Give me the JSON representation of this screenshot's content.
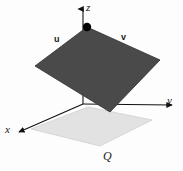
{
  "figure": {
    "background": "#fdfdfd"
  },
  "axes": {
    "z": {
      "label": "z",
      "origin": [
        83,
        104
      ],
      "tip": [
        83,
        5
      ]
    },
    "y": {
      "label": "y",
      "origin": [
        83,
        104
      ],
      "tip": [
        176,
        105
      ]
    },
    "x": {
      "label": "x",
      "origin": [
        83,
        104
      ],
      "tip": [
        17,
        133
      ]
    },
    "color": "#111111"
  },
  "vectors": {
    "u": {
      "label": "u",
      "color": "#111111"
    },
    "v": {
      "label": "v",
      "color": "#111111"
    }
  },
  "surfaces": {
    "tangent_plane": {
      "name": "tangent-plane",
      "fill": "#4a4a4a",
      "stroke": "#2f2f2f",
      "points": "87,27 160,60 110,112 35,66"
    },
    "base_plane": {
      "name": "region-Q",
      "label": "Q",
      "fill": "#e2e2e2",
      "stroke": "#cfcfcf",
      "points": "88,107 152,120 100,146 31,129"
    }
  },
  "point": {
    "name": "tangency-point",
    "color": "#000000",
    "cx": 87,
    "cy": 27,
    "r": 4.2
  },
  "chart_data": {
    "type": "diagram",
    "elements": [
      {
        "kind": "axis",
        "name": "x",
        "label": "x"
      },
      {
        "kind": "axis",
        "name": "y",
        "label": "y"
      },
      {
        "kind": "axis",
        "name": "z",
        "label": "z"
      },
      {
        "kind": "vector",
        "name": "u",
        "label": "u"
      },
      {
        "kind": "vector",
        "name": "v",
        "label": "v"
      },
      {
        "kind": "surface",
        "name": "tangent-plane",
        "label": ""
      },
      {
        "kind": "surface",
        "name": "base-region",
        "label": "Q"
      },
      {
        "kind": "point",
        "name": "tangency-point",
        "label": ""
      }
    ]
  }
}
